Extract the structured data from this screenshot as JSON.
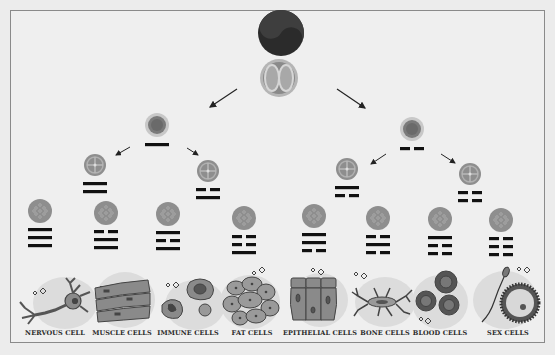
{
  "colors": {
    "background": "#efefef",
    "frame": "#8a8a8a",
    "cell_fill": "#9a9a9a",
    "cell_ring": "#c4c4c4",
    "line": "#111111",
    "zygote": "#2b2b2b",
    "blob": "#dcdcdc"
  },
  "root": {
    "zygote_label": "yin-yang zygote",
    "embryo_label": "two-cell embryo"
  },
  "levels": [
    {
      "name": "level-1",
      "nodes": [
        {
          "lines": [
            "solid"
          ]
        },
        {
          "lines": [
            "broken"
          ]
        }
      ]
    },
    {
      "name": "level-2",
      "nodes": [
        {
          "lines": [
            "solid",
            "solid"
          ]
        },
        {
          "lines": [
            "broken",
            "solid"
          ]
        },
        {
          "lines": [
            "solid",
            "broken"
          ]
        },
        {
          "lines": [
            "broken",
            "broken"
          ]
        }
      ]
    },
    {
      "name": "level-3",
      "nodes": [
        {
          "lines": [
            "solid",
            "solid",
            "solid"
          ]
        },
        {
          "lines": [
            "broken",
            "solid",
            "solid"
          ]
        },
        {
          "lines": [
            "solid",
            "broken",
            "solid"
          ]
        },
        {
          "lines": [
            "broken",
            "broken",
            "solid"
          ]
        },
        {
          "lines": [
            "solid",
            "solid",
            "broken"
          ]
        },
        {
          "lines": [
            "broken",
            "solid",
            "broken"
          ]
        },
        {
          "lines": [
            "solid",
            "broken",
            "broken"
          ]
        },
        {
          "lines": [
            "broken",
            "broken",
            "broken"
          ]
        }
      ]
    }
  ],
  "cell_types": [
    {
      "label": "NERVOUS CELL",
      "icon": "neuron-icon"
    },
    {
      "label": "MUSCLE CELLS",
      "icon": "muscle-fiber-icon"
    },
    {
      "label": "IMMUNE CELLS",
      "icon": "immune-cell-icon"
    },
    {
      "label": "FAT CELLS",
      "icon": "fat-cell-icon"
    },
    {
      "label": "EPITHELIAL CELLS",
      "icon": "epithelial-cell-icon"
    },
    {
      "label": "BONE CELLS",
      "icon": "bone-cell-icon"
    },
    {
      "label": "BLOOD CELLS",
      "icon": "blood-cell-icon"
    },
    {
      "label": "SEX CELLS",
      "icon": "sex-cell-icon"
    }
  ]
}
